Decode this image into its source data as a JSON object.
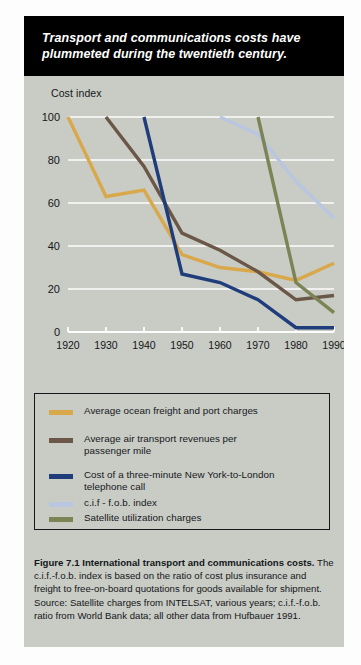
{
  "banner": {
    "line1": "Transport and communications costs have",
    "line2": "plummeted during the twentieth century."
  },
  "colors": {
    "ocean_freight": "#d9a84b",
    "air_transport": "#6b5748",
    "telephone": "#1f3d7a",
    "cif_fob": "#b8c6e0",
    "satellite": "#7c8355",
    "background": "#c9cbc5",
    "gridline": "#fdfdfd",
    "banner_bg": "#000000",
    "text": "#14171a"
  },
  "legend": {
    "items": [
      {
        "label": "Average ocean freight and port charges",
        "color_key": "ocean_freight"
      },
      {
        "label": "Average air transport revenues per\npassenger mile",
        "color_key": "air_transport"
      },
      {
        "label": "Cost of a three-minute New York-to-London\ntelephone call",
        "color_key": "telephone"
      },
      {
        "label": "c.i.f - f.o.b. index",
        "color_key": "cif_fob"
      },
      {
        "label": "Satellite utilization charges",
        "color_key": "satellite"
      }
    ]
  },
  "caption": {
    "bold_lead": "Figure 7.1  International transport and communications costs.",
    "body": " The c.i.f.-f.o.b. index is based on the ratio of cost plus insurance and freight to free-on-board quotations for goods available for shipment.  Source: Satellite charges from INTELSAT, various years; c.i.f.-f.o.b. ratio from World Bank data; all other data from Hufbauer 1991."
  },
  "chart_data": {
    "type": "line",
    "title": "Transport and communications costs have plummeted during the twentieth century.",
    "xlabel": "",
    "ylabel": "Cost index",
    "xlim": [
      1920,
      1990
    ],
    "ylim": [
      0,
      100
    ],
    "xticks": [
      1920,
      1930,
      1940,
      1950,
      1960,
      1970,
      1980,
      1990
    ],
    "yticks": [
      0,
      20,
      40,
      60,
      80,
      100
    ],
    "grid": true,
    "legend_position": "below-plot",
    "series": [
      {
        "name": "Average ocean freight and port charges",
        "color": "#d9a84b",
        "x": [
          1920,
          1930,
          1940,
          1950,
          1960,
          1970,
          1980,
          1990
        ],
        "y": [
          100,
          63,
          66,
          36,
          30,
          28,
          24,
          32
        ]
      },
      {
        "name": "Average air transport revenues per passenger mile",
        "color": "#6b5748",
        "x": [
          1930,
          1940,
          1950,
          1960,
          1970,
          1980,
          1990
        ],
        "y": [
          100,
          77,
          46,
          38,
          28,
          15,
          17
        ]
      },
      {
        "name": "Cost of a three-minute New York-to-London telephone call",
        "color": "#1f3d7a",
        "x": [
          1940,
          1950,
          1960,
          1970,
          1980,
          1990
        ],
        "y": [
          100,
          27,
          23,
          15,
          2,
          2
        ]
      },
      {
        "name": "c.i.f - f.o.b. index",
        "color": "#b8c6e0",
        "x": [
          1960,
          1970,
          1980,
          1990
        ],
        "y": [
          100,
          92,
          70,
          53
        ]
      },
      {
        "name": "Satellite utilization charges",
        "color": "#7c8355",
        "x": [
          1970,
          1980,
          1990
        ],
        "y": [
          100,
          23,
          9
        ]
      }
    ]
  }
}
